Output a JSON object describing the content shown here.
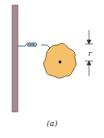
{
  "figure": {
    "caption": "(a)",
    "dimension_label": "r",
    "colors": {
      "wall": "#a88a8e",
      "wall_edge": "#7a6266",
      "spring": "#4f6f8a",
      "body_fill": "#f6c06a",
      "body_edge": "#6b4a2a",
      "pivot": "#111111",
      "dimension": "#333333"
    },
    "elements": [
      "wall",
      "coil-spring",
      "irregular-body",
      "pivot-point",
      "dimension-r"
    ]
  }
}
